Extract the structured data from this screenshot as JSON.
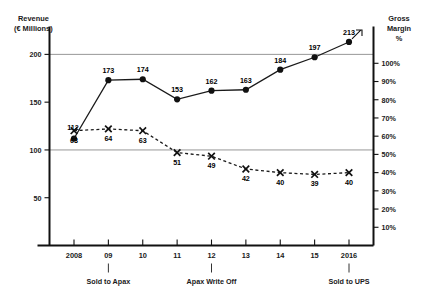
{
  "chart_data": {
    "type": "line",
    "title": "",
    "x": [
      "2008",
      "09",
      "10",
      "11",
      "12",
      "13",
      "14",
      "15",
      "2016"
    ],
    "categories": [
      "2008",
      "09",
      "10",
      "11",
      "12",
      "13",
      "14",
      "15",
      "2016"
    ],
    "series": [
      {
        "name": "Revenue",
        "axis": "left",
        "style": "solid-circle",
        "values": [
          112,
          173,
          174,
          153,
          162,
          163,
          184,
          197,
          213
        ]
      },
      {
        "name": "Gross Margin",
        "axis": "right",
        "style": "dashed-x",
        "values": [
          63,
          64,
          63,
          51,
          49,
          42,
          40,
          39,
          40
        ]
      }
    ],
    "left_axis": {
      "label_line1": "Revenue",
      "label_line2": "(€ Millions)",
      "ticks": [
        50,
        100,
        150,
        200
      ],
      "tick_labels": [
        "50",
        "100",
        "150",
        "200"
      ],
      "ylim": [
        0,
        225
      ]
    },
    "right_axis": {
      "label_line1": "Gross",
      "label_line2": "Margin",
      "label_line3": "%",
      "ticks": [
        10,
        20,
        30,
        40,
        50,
        60,
        70,
        80,
        90,
        100
      ],
      "tick_labels": [
        "10%",
        "20%",
        "30%",
        "40%",
        "50%",
        "60%",
        "70%",
        "80%",
        "90%",
        "100%"
      ],
      "ylim": [
        0,
        118
      ]
    },
    "gridlines": [
      {
        "value": 200,
        "axis": "left"
      },
      {
        "value": 100,
        "axis": "left"
      }
    ],
    "grid": true,
    "legend": "none",
    "annotations": [
      {
        "x": "09",
        "text": "Sold to Apax"
      },
      {
        "x": "12",
        "text": "Apax Write Off"
      },
      {
        "x": "2016",
        "text": "Sold to UPS"
      }
    ]
  },
  "colors": {
    "line": "#1a1a1a",
    "axis": "#111111",
    "grid": "#8c8c8c",
    "text": "#1a1a1a",
    "background": "#ffffff"
  }
}
